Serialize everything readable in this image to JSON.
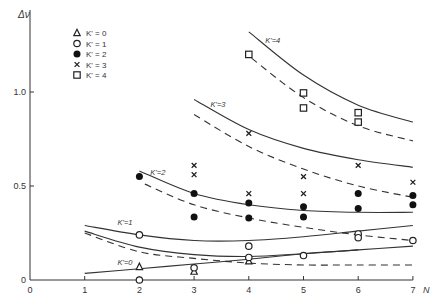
{
  "chart_data": {
    "type": "scatter",
    "title": "",
    "xlabel": "N",
    "ylabel": "Δν",
    "xlim": [
      0,
      7
    ],
    "ylim": [
      0,
      1.3
    ],
    "x_ticks": [
      "0",
      "1",
      "2",
      "3",
      "4",
      "5",
      "6",
      "7"
    ],
    "y_ticks": [
      "0",
      "0.5",
      "1.0"
    ],
    "grid": false,
    "legend_position": "upper-left",
    "legend": [
      {
        "label": "K' = 0",
        "marker": "triangle-open"
      },
      {
        "label": "K' = 1",
        "marker": "circle-open"
      },
      {
        "label": "K' = 2",
        "marker": "circle-filled"
      },
      {
        "label": "K' = 3",
        "marker": "cross"
      },
      {
        "label": "K' = 4",
        "marker": "square-open"
      }
    ],
    "series": [
      {
        "name": "K' = 0",
        "marker": "triangle-open",
        "points": [
          [
            2,
            0.07
          ],
          [
            3,
            0.045
          ],
          [
            4,
            0.1
          ]
        ]
      },
      {
        "name": "K' = 1",
        "marker": "circle-open",
        "points": [
          [
            2,
            0.24
          ],
          [
            2,
            0.0
          ],
          [
            3,
            0.065
          ],
          [
            4,
            0.18
          ],
          [
            4,
            0.12
          ],
          [
            5,
            0.13
          ],
          [
            6,
            0.245
          ],
          [
            6,
            0.225
          ],
          [
            7,
            0.21
          ]
        ]
      },
      {
        "name": "K' = 2",
        "marker": "circle-filled",
        "points": [
          [
            2,
            0.55
          ],
          [
            3,
            0.46
          ],
          [
            3,
            0.335
          ],
          [
            4,
            0.41
          ],
          [
            4,
            0.33
          ],
          [
            5,
            0.39
          ],
          [
            5,
            0.335
          ],
          [
            6,
            0.46
          ],
          [
            6,
            0.38
          ],
          [
            7,
            0.45
          ],
          [
            7,
            0.4
          ]
        ]
      },
      {
        "name": "K' = 3",
        "marker": "cross",
        "points": [
          [
            3,
            0.61
          ],
          [
            3,
            0.56
          ],
          [
            4,
            0.78
          ],
          [
            4,
            0.46
          ],
          [
            5,
            0.55
          ],
          [
            5,
            0.46
          ],
          [
            6,
            0.61
          ],
          [
            7,
            0.52
          ]
        ]
      },
      {
        "name": "K' = 4",
        "marker": "square-open",
        "points": [
          [
            4,
            1.2
          ],
          [
            5,
            0.995
          ],
          [
            5,
            0.915
          ],
          [
            6,
            0.89
          ],
          [
            6,
            0.84
          ]
        ]
      }
    ],
    "curves": [
      {
        "label": "K' = 4",
        "style": "solid",
        "points": [
          [
            4,
            1.32
          ],
          [
            5,
            1.09
          ],
          [
            6,
            0.93
          ],
          [
            7,
            0.84
          ]
        ]
      },
      {
        "label": "K' = 4",
        "style": "dashed",
        "points": [
          [
            4.05,
            1.18
          ],
          [
            5,
            0.97
          ],
          [
            6,
            0.82
          ],
          [
            7,
            0.74
          ]
        ]
      },
      {
        "label": "K' = 3",
        "style": "solid",
        "points": [
          [
            3,
            0.96
          ],
          [
            4,
            0.8
          ],
          [
            5,
            0.7
          ],
          [
            6,
            0.64
          ],
          [
            7,
            0.6
          ]
        ]
      },
      {
        "label": "K' = 3",
        "style": "dashed",
        "points": [
          [
            3,
            0.88
          ],
          [
            4,
            0.71
          ],
          [
            5,
            0.59
          ],
          [
            6,
            0.5
          ],
          [
            7,
            0.44
          ]
        ]
      },
      {
        "label": "K' = 2",
        "style": "solid",
        "points": [
          [
            2,
            0.58
          ],
          [
            3,
            0.46
          ],
          [
            4,
            0.4
          ],
          [
            5,
            0.37
          ],
          [
            6,
            0.36
          ],
          [
            7,
            0.36
          ]
        ]
      },
      {
        "label": "K' = 2",
        "style": "dashed",
        "points": [
          [
            2.1,
            0.51
          ],
          [
            3,
            0.4
          ],
          [
            4,
            0.33
          ],
          [
            5,
            0.28
          ],
          [
            6,
            0.24
          ],
          [
            7,
            0.21
          ]
        ]
      },
      {
        "label": "K' = 1",
        "style": "solid",
        "points": [
          [
            1,
            0.29
          ],
          [
            2,
            0.24
          ],
          [
            3,
            0.21
          ],
          [
            4,
            0.21
          ],
          [
            5,
            0.23
          ],
          [
            6,
            0.26
          ],
          [
            7,
            0.29
          ]
        ]
      },
      {
        "label": "K' = 1",
        "style": "solid",
        "points": [
          [
            1,
            0.26
          ],
          [
            2,
            0.175
          ],
          [
            3,
            0.135
          ],
          [
            4,
            0.125
          ],
          [
            5,
            0.14
          ],
          [
            6,
            0.16
          ],
          [
            7,
            0.18
          ]
        ]
      },
      {
        "label": "K' = 1",
        "style": "dashed",
        "points": [
          [
            1,
            0.25
          ],
          [
            2,
            0.15
          ],
          [
            3,
            0.115
          ],
          [
            4,
            0.09
          ],
          [
            5,
            0.08
          ],
          [
            6,
            0.08
          ],
          [
            7,
            0.08
          ]
        ]
      },
      {
        "label": "K' = 0",
        "style": "solid",
        "points": [
          [
            1,
            0.035
          ],
          [
            2,
            0.06
          ],
          [
            3,
            0.085
          ],
          [
            4,
            0.11
          ],
          [
            5,
            0.14
          ],
          [
            6,
            0.16
          ]
        ]
      }
    ],
    "curve_labels": [
      {
        "text": "K'=4",
        "x": 4.3,
        "y": 1.26
      },
      {
        "text": "K'=3",
        "x": 3.3,
        "y": 0.92
      },
      {
        "text": "K'=2",
        "x": 2.2,
        "y": 0.56
      },
      {
        "text": "K'=1",
        "x": 1.6,
        "y": 0.29
      },
      {
        "text": "K'=0",
        "x": 1.6,
        "y": 0.08
      }
    ]
  }
}
